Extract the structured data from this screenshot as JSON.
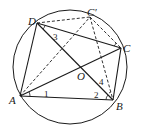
{
  "diagram": {
    "type": "geometry",
    "circle": {
      "cx": 70,
      "cy": 67,
      "r": 57,
      "color": "#1a1a1a"
    },
    "points": {
      "A": {
        "label": "A",
        "x": 20,
        "y": 96,
        "lx": 9,
        "ly": 104
      },
      "B": {
        "label": "B",
        "x": 113,
        "y": 100,
        "lx": 117,
        "ly": 111
      },
      "C": {
        "label": "C",
        "x": 121,
        "y": 48,
        "lx": 123,
        "ly": 52
      },
      "D": {
        "label": "D",
        "x": 37,
        "y": 23,
        "lx": 28,
        "ly": 25
      },
      "C_prime": {
        "label": "C′",
        "x": 90,
        "y": 17,
        "lx": 87,
        "ly": 16
      },
      "O": {
        "label": "O",
        "x": 80,
        "y": 68,
        "lx": 77,
        "ly": 80
      }
    },
    "angle_labels": [
      {
        "label": "1",
        "x": 44,
        "y": 97
      },
      {
        "label": "2",
        "x": 94,
        "y": 98
      },
      {
        "label": "3",
        "x": 53,
        "y": 40
      },
      {
        "label": "4",
        "x": 99,
        "y": 85
      }
    ],
    "solid_segments": [
      [
        "A",
        "B"
      ],
      [
        "B",
        "C"
      ],
      [
        "C",
        "D"
      ],
      [
        "D",
        "A"
      ],
      [
        "A",
        "C"
      ],
      [
        "D",
        "B"
      ]
    ],
    "dashed_segments": [
      [
        "D",
        "C_prime"
      ],
      [
        "C_prime",
        "C"
      ],
      [
        "A",
        "C_prime"
      ],
      [
        "C_prime",
        "B"
      ]
    ]
  }
}
